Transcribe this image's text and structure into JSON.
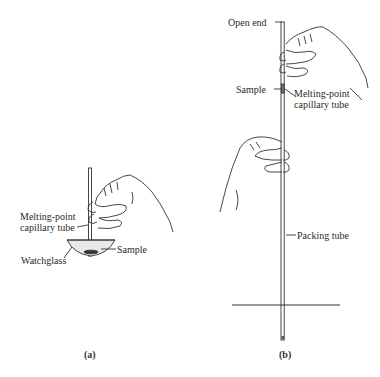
{
  "panel_a": {
    "caption": "(a)",
    "labels": {
      "tube_line1": "Melting-point",
      "tube_line2": "capillary tube",
      "sample": "Sample",
      "watchglass": "Watchglass"
    }
  },
  "panel_b": {
    "caption": "(b)",
    "labels": {
      "open_end": "Open end",
      "sample": "Sample",
      "tube_line1": "Melting-point",
      "tube_line2": "capillary tube",
      "packing_tube": "Packing tube"
    }
  }
}
